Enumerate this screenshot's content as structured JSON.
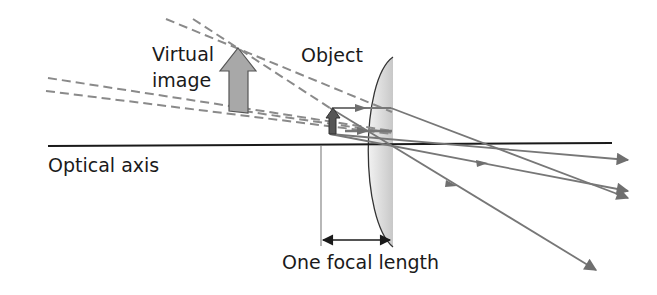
{
  "labels": {
    "virtual_image_line1": "Virtual",
    "virtual_image_line2": "image",
    "object": "Object",
    "optical_axis": "Optical axis",
    "focal_length": "One focal length"
  },
  "colors": {
    "axis": "#1a1a1a",
    "ray": "#777777",
    "virtual_ray": "#8a8a8a",
    "object_arrow": "#555555",
    "image_arrow": "#a8a8a8",
    "lens_fill": "#d4d4d4"
  }
}
